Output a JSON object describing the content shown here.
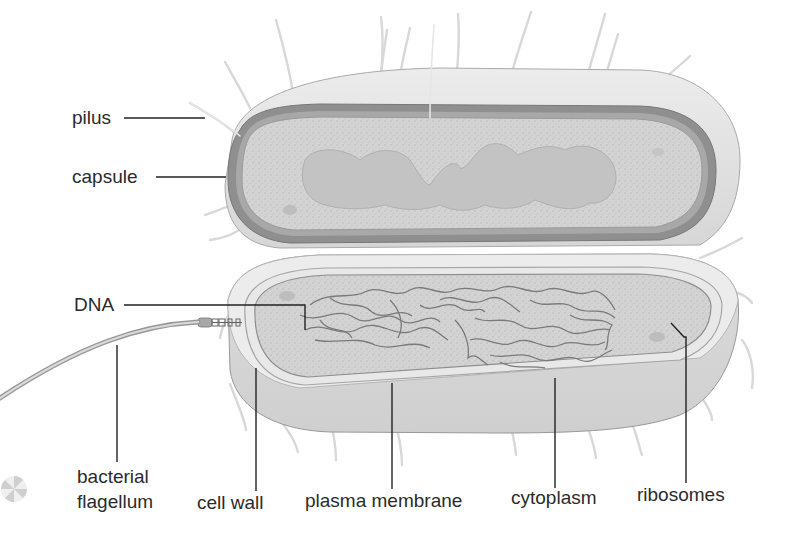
{
  "diagram": {
    "colors": {
      "background": "#ffffff",
      "capsule": "#8f8f8f",
      "cytoplasm": "#d4d4d4",
      "outer_surface": "#e4e4e4",
      "leader_line": "#222222",
      "label_text": "#2b2b2b"
    },
    "labels": {
      "pilus": "pilus",
      "capsule": "capsule",
      "dna": "DNA",
      "bacterial_flagellum_line1": "bacterial",
      "bacterial_flagellum_line2": "flagellum",
      "cell_wall": "cell wall",
      "plasma_membrane": "plasma membrane",
      "cytoplasm": "cytoplasm",
      "ribosomes": "ribosomes"
    }
  }
}
